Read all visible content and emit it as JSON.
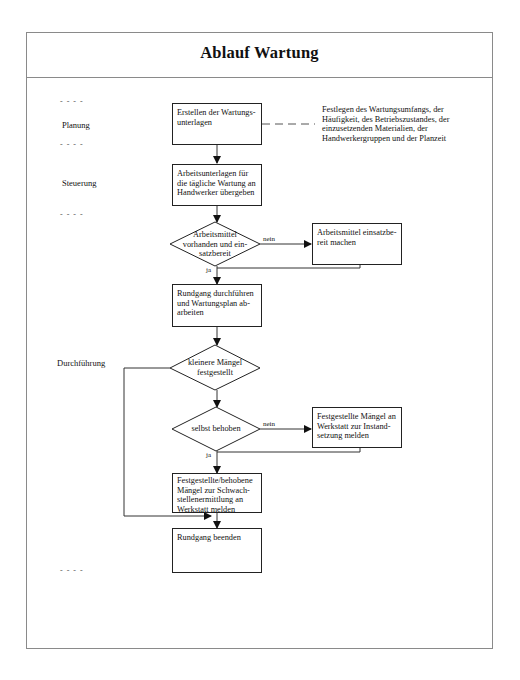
{
  "title": "Ablauf Wartung",
  "phases": [
    {
      "label": "Planung"
    },
    {
      "label": "Steuerung"
    },
    {
      "label": "Durchführung"
    }
  ],
  "phase_separator": "- - - -",
  "nodes": {
    "box_erstellen": "Erstellen der Wartungs-\nunterlagen",
    "box_arbeitsunterlagen": "Arbeitsunterlagen für\ndie tägliche Wartung an\nHandwerker übergeben",
    "decision_arbeitsmittel": "Arbeitsmittel\nvorhanden und ein-\nsatzbereit",
    "box_einsatzbereit": "Arbeitsmittel einsatzbe-\nreit machen",
    "box_rundgang": "Rundgang durchführen\nund Wartungsplan ab-\narbeiten",
    "decision_maengel": "kleinere Mängel\nfestgestellt",
    "decision_behoben": "selbst behoben",
    "box_instandsetzung": "Festgestellte Mängel an\nWerkstatt zur Instand-\nsetzung melden",
    "box_schwachstellen": "Festgestellte/behobene\nMängel zur Schwach-\nstellenermittlung an\nWerkstatt melden",
    "box_beenden": "Rundgang beenden"
  },
  "annotation": "Festlegen des Wartungsumfangs, der\nHäufigkeit, des Betriebszustandes, der\neinzusetzenden Materialien, der\nHandwerkergruppen und der Planzeit",
  "edge_labels": {
    "nein_1": "nein",
    "ja_1": "ja",
    "nein_2": "nein",
    "ja_2": "ja"
  }
}
